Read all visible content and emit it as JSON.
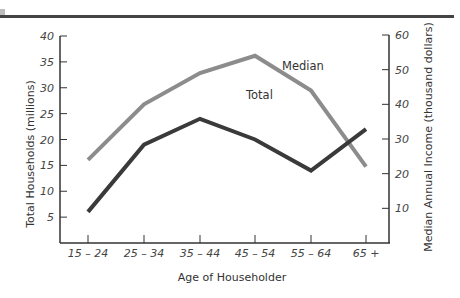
{
  "chart_data": {
    "type": "line",
    "title": "",
    "xlabel": "Age of Householder",
    "ylabel": "Total Households (millions)",
    "y2label": "Median Annual Income (thousand dollars)",
    "categories": [
      "15 – 24",
      "25 – 34",
      "35 – 44",
      "45 – 54",
      "55 – 64",
      "65 +"
    ],
    "series": [
      {
        "name": "Total",
        "axis": "left",
        "color": "#3a3a3a",
        "values": [
          6,
          19,
          24,
          20,
          14,
          22
        ]
      },
      {
        "name": "Median",
        "axis": "right",
        "color": "#8c8c8c",
        "values": [
          24,
          40,
          49,
          54,
          44,
          22
        ]
      }
    ],
    "ylim": [
      0,
      40
    ],
    "yticks": [
      "5",
      "10",
      "15",
      "20",
      "25",
      "30",
      "35",
      "40"
    ],
    "y2lim": [
      0,
      60
    ],
    "y2ticks": [
      "10",
      "20",
      "30",
      "40",
      "50",
      "60"
    ],
    "grid": false,
    "legend": "inline labels"
  },
  "labels": {
    "total": "Total",
    "median": "Median"
  }
}
